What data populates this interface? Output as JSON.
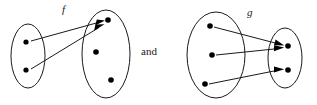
{
  "figure": {
    "kind": "function-mapping-diagram-pair",
    "background_color": "#ffffff",
    "stroke_color": "#1a1a1a",
    "dot_color": "#000000",
    "conjunction_label": "and",
    "diagrams": [
      {
        "id": "diagram-f",
        "label": "f",
        "label_position": {
          "x": 62,
          "y": 13
        },
        "domain_set": {
          "name": "domain-ellipse-f",
          "cx": 28,
          "cy": 56,
          "rx": 17,
          "ry": 32,
          "dots": [
            {
              "name": "domain-element-f-1",
              "cx": 26,
              "cy": 42,
              "r": 2.6
            },
            {
              "name": "domain-element-f-2",
              "cx": 26,
              "cy": 70,
              "r": 2.6
            }
          ]
        },
        "codomain_set": {
          "name": "codomain-ellipse-f",
          "cx": 106,
          "cy": 54,
          "rx": 24,
          "ry": 44,
          "dots": [
            {
              "name": "codomain-element-f-1",
              "cx": 108,
              "cy": 20,
              "r": 2.8
            },
            {
              "name": "codomain-element-f-2",
              "cx": 96,
              "cy": 52,
              "r": 2.8
            },
            {
              "name": "codomain-element-f-3",
              "cx": 111,
              "cy": 80,
              "r": 2.8
            }
          ]
        },
        "arrows": [
          {
            "name": "arrow-f-1",
            "x1": 31,
            "y1": 41,
            "x2": 104,
            "y2": 21
          },
          {
            "name": "arrow-f-2",
            "x1": 31,
            "y1": 69,
            "x2": 103,
            "y2": 25
          }
        ]
      },
      {
        "id": "diagram-g",
        "label": "g",
        "label_position": {
          "x": 247,
          "y": 16
        },
        "domain_set": {
          "name": "domain-ellipse-g",
          "cx": 216,
          "cy": 55,
          "rx": 29,
          "ry": 43,
          "dots": [
            {
              "name": "domain-element-g-1",
              "cx": 210,
              "cy": 26,
              "r": 2.8
            },
            {
              "name": "domain-element-g-2",
              "cx": 212,
              "cy": 55,
              "r": 2.8
            },
            {
              "name": "domain-element-g-3",
              "cx": 205,
              "cy": 84,
              "r": 2.8
            }
          ]
        },
        "codomain_set": {
          "name": "codomain-ellipse-g",
          "cx": 285,
          "cy": 58,
          "rx": 17,
          "ry": 30,
          "dots": [
            {
              "name": "codomain-element-g-1",
              "cx": 288,
              "cy": 46,
              "r": 2.8
            },
            {
              "name": "codomain-element-g-2",
              "cx": 288,
              "cy": 70,
              "r": 2.8
            }
          ]
        },
        "arrows": [
          {
            "name": "arrow-g-1",
            "x1": 214,
            "y1": 27,
            "x2": 283,
            "y2": 45
          },
          {
            "name": "arrow-g-2",
            "x1": 216,
            "y1": 55,
            "x2": 283,
            "y2": 47
          },
          {
            "name": "arrow-g-3",
            "x1": 209,
            "y1": 84,
            "x2": 283,
            "y2": 69
          }
        ]
      }
    ]
  }
}
